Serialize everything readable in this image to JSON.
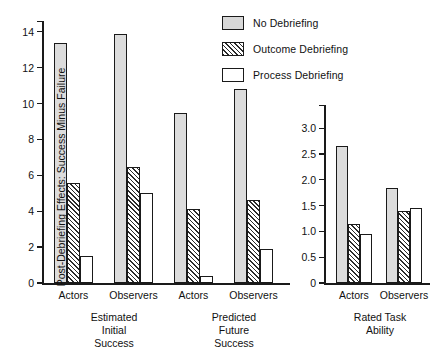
{
  "legend": {
    "items": [
      {
        "label": "No Debriefing",
        "pattern": "dotted",
        "icon": "swatch-dotted-icon"
      },
      {
        "label": "Outcome Debriefing",
        "pattern": "hatched",
        "icon": "swatch-hatched-icon"
      },
      {
        "label": "Process Debriefing",
        "pattern": "open",
        "icon": "swatch-open-icon"
      }
    ]
  },
  "chart_data": [
    {
      "type": "bar",
      "id": "left-panel",
      "title": "",
      "xlabel": "",
      "ylabel": "Post-Debriefing Effects: Success Minus Failure",
      "ylim": [
        0,
        14.6
      ],
      "yticks": [
        0,
        2,
        4,
        6,
        8,
        10,
        12,
        14
      ],
      "ytick_labels": [
        "0",
        "2",
        "4",
        "6",
        "8",
        "10",
        "12",
        "14"
      ],
      "grid": false,
      "legend_position": "top-right",
      "categories": [
        "Actors",
        "Observers",
        "Actors",
        "Observers"
      ],
      "section_labels": [
        "Estimated\nInitial\nSuccess",
        "Predicted\nFuture\nSuccess"
      ],
      "series": [
        {
          "name": "No Debriefing",
          "pattern": "dotted",
          "values": [
            13.4,
            13.85,
            9.45,
            10.8
          ]
        },
        {
          "name": "Outcome Debriefing",
          "pattern": "hatched",
          "values": [
            5.6,
            6.45,
            4.1,
            4.6
          ]
        },
        {
          "name": "Process Debriefing",
          "pattern": "open",
          "values": [
            1.5,
            5.0,
            0.4,
            1.9
          ]
        }
      ]
    },
    {
      "type": "bar",
      "id": "right-panel",
      "title": "",
      "xlabel": "",
      "ylabel": "",
      "ylim": [
        0,
        3.45
      ],
      "yticks": [
        0,
        0.5,
        1.0,
        1.5,
        2.0,
        2.5,
        3.0
      ],
      "ytick_labels": [
        "0",
        "0.5",
        "1.0",
        "1.5",
        "2.0",
        "2.5",
        "3.0"
      ],
      "grid": false,
      "categories": [
        "Actors",
        "Observers"
      ],
      "section_labels": [
        "Rated Task\nAbility"
      ],
      "series": [
        {
          "name": "No Debriefing",
          "pattern": "dotted",
          "values": [
            2.65,
            1.85
          ]
        },
        {
          "name": "Outcome Debriefing",
          "pattern": "hatched",
          "values": [
            1.15,
            1.4
          ]
        },
        {
          "name": "Process Debriefing",
          "pattern": "open",
          "values": [
            0.95,
            1.45
          ]
        }
      ]
    }
  ]
}
